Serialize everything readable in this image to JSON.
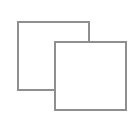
{
  "icon": {
    "name": "copy-icon",
    "stroke_color": "#8f8f8f",
    "fill_color": "#ffffff"
  }
}
